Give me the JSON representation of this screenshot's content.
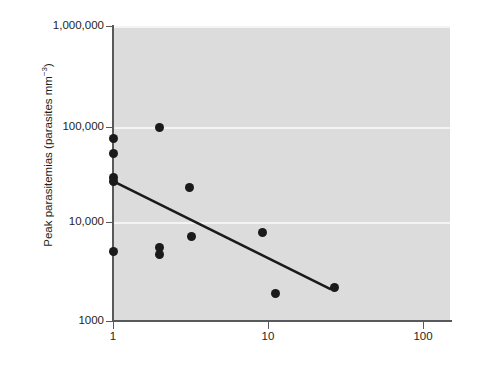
{
  "chart_data": {
    "type": "scatter",
    "title": "",
    "xlabel": "",
    "ylabel": "Peak parasitemias (parasites mm−3)",
    "ylabel_main": "Peak parasitemias (parasites mm",
    "ylabel_sup": "−3",
    "ylabel_tail": ")",
    "xscale": "log",
    "yscale": "log",
    "xlim": [
      1,
      160
    ],
    "ylim": [
      1000,
      1000000
    ],
    "grid": true,
    "legend": null,
    "x_ticks": [
      {
        "value": 1,
        "label": "1"
      },
      {
        "value": 10,
        "label": "10"
      },
      {
        "value": 100,
        "label": "100"
      }
    ],
    "y_ticks": [
      {
        "value": 1000000,
        "label": "1,000,000"
      },
      {
        "value": 100000,
        "label": "100,000"
      },
      {
        "value": 10000,
        "label": "10,000"
      },
      {
        "value": 1000,
        "label": "1000"
      }
    ],
    "points": [
      {
        "x": 1,
        "y": 72000
      },
      {
        "x": 1,
        "y": 50000
      },
      {
        "x": 1,
        "y": 29000
      },
      {
        "x": 1,
        "y": 26000
      },
      {
        "x": 1,
        "y": 5100
      },
      {
        "x": 2,
        "y": 93000
      },
      {
        "x": 2,
        "y": 5600
      },
      {
        "x": 2,
        "y": 4800
      },
      {
        "x": 3.1,
        "y": 23000
      },
      {
        "x": 3.2,
        "y": 7300
      },
      {
        "x": 9.2,
        "y": 7900
      },
      {
        "x": 11.2,
        "y": 1900
      },
      {
        "x": 27,
        "y": 2200
      }
    ],
    "trendline": {
      "x_start": 1,
      "y_start": 26500,
      "x_end": 25.5,
      "y_end": 2100,
      "color": "#1a1a1a"
    },
    "colors": {
      "plot_background": "#dcdcdc",
      "gridline": "#f4f4f4",
      "axis": "#58595b",
      "marker": "#1a1a1a",
      "page_background": "#ffffff",
      "text": "#231f20"
    }
  }
}
